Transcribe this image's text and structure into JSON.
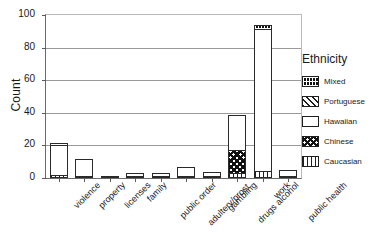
{
  "chart_data": {
    "type": "bar",
    "subtype": "stacked-bar",
    "title": "",
    "xlabel": "",
    "ylabel": "Count",
    "ylim": [
      0,
      100
    ],
    "yticks": [
      0,
      20,
      40,
      60,
      80,
      100
    ],
    "grid": true,
    "legend_position": "right",
    "legend_title": "Ethnicity",
    "categories": [
      "violence",
      "property",
      "licenses",
      "family",
      "public order",
      "adultery/prost.",
      "gambling",
      "drugs alcohol",
      "work",
      "public health"
    ],
    "series": [
      {
        "name": "Caucasian",
        "pattern": "vertical-lines",
        "values": [
          2,
          1,
          1,
          1,
          1,
          1,
          1,
          3,
          4,
          1
        ]
      },
      {
        "name": "Chinese",
        "pattern": "checkerboard",
        "values": [
          0,
          0,
          0,
          0,
          0,
          0,
          0,
          15,
          0,
          0
        ]
      },
      {
        "name": "Hawaiian",
        "pattern": "solid-white",
        "values": [
          19,
          11,
          0,
          2,
          2,
          6,
          3,
          22,
          88,
          4
        ]
      },
      {
        "name": "Portuguese",
        "pattern": "diagonal-lines",
        "values": [
          0,
          0,
          0,
          0,
          0,
          0,
          0,
          0,
          0,
          0
        ]
      },
      {
        "name": "Mixed",
        "pattern": "dense-grid",
        "values": [
          2,
          0,
          0,
          0,
          0,
          0,
          0,
          0,
          3,
          0
        ]
      }
    ],
    "totals": [
      23,
      12,
      1,
      3,
      3,
      7,
      4,
      40,
      95,
      5
    ]
  },
  "axes": {
    "y_label": "Count",
    "y_ticks": [
      "0",
      "20",
      "40",
      "60",
      "80",
      "100"
    ]
  },
  "legend": {
    "title": "Ethnicity",
    "items": [
      {
        "label": "Mixed"
      },
      {
        "label": "Portuguese"
      },
      {
        "label": "Hawaiian"
      },
      {
        "label": "Chinese"
      },
      {
        "label": "Caucasian"
      }
    ]
  }
}
